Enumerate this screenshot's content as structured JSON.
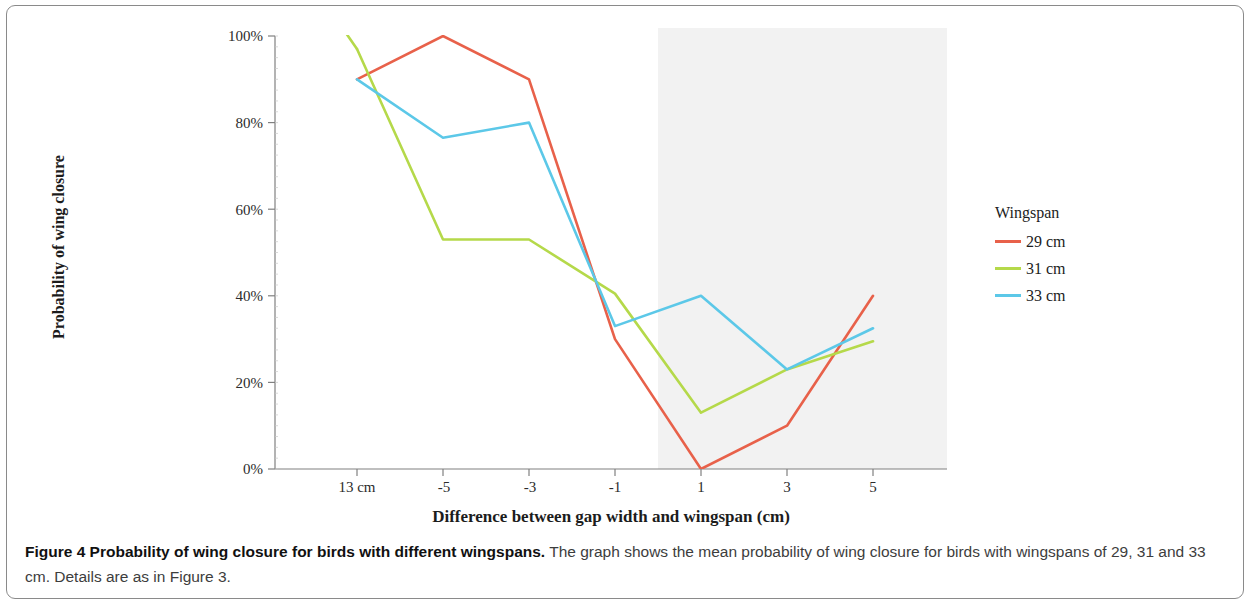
{
  "figure": {
    "caption_bold": "Figure 4 Probability of wing closure for birds with different wingspans.",
    "caption_rest": " The graph shows the mean probability of wing closure for birds with wingspans of 29, 31 and 33 cm. Details are as in Figure 3."
  },
  "chart_data": {
    "type": "line",
    "title": "",
    "xlabel": "Difference between gap width and wingspan (cm)",
    "ylabel": "Probability of wing closure",
    "categories": [
      "13 cm",
      "-5",
      "-3",
      "-1",
      "1",
      "3",
      "5"
    ],
    "x_tick_labels": [
      "13 cm",
      "-5",
      "-3",
      "-1",
      "1",
      "3",
      "5"
    ],
    "y_tick_labels": [
      "0%",
      "20%",
      "40%",
      "60%",
      "80%",
      "100%"
    ],
    "y_tick_values": [
      0,
      20,
      40,
      60,
      80,
      100
    ],
    "ylim": [
      0,
      100
    ],
    "grid": false,
    "legend_position": "right",
    "legend_title": "Wingspan",
    "series": [
      {
        "name": "29 cm",
        "color": "#E8614A",
        "values": [
          90,
          100,
          90,
          30,
          0,
          10,
          40
        ]
      },
      {
        "name": "31 cm",
        "color": "#B5D94A",
        "values": [
          97,
          53,
          53,
          40.5,
          13,
          23,
          29.5
        ]
      },
      {
        "name": "33 cm",
        "color": "#5CC8E8",
        "values": [
          90,
          76.5,
          80,
          33,
          40,
          23,
          32.5
        ]
      }
    ],
    "annotations": [
      {
        "name": "wider-than-wingspan",
        "line1": "Wider than",
        "line2": "wingspan",
        "shaded_from_category": "1",
        "shade_color": "#F2F2F2"
      }
    ]
  }
}
